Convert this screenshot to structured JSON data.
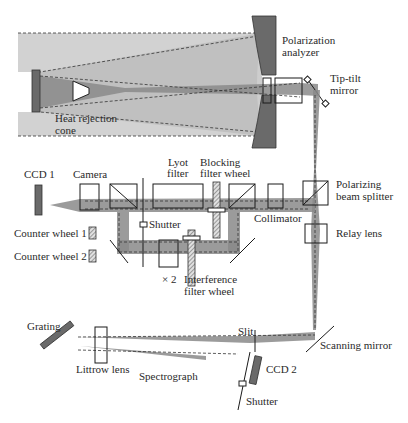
{
  "diagram": {
    "type": "optical-layout",
    "labels": {
      "polarization_analyzer_1": "Polarization",
      "polarization_analyzer_2": "analyzer",
      "tip_tilt_1": "Tip-tilt",
      "tip_tilt_2": "mirror",
      "heat_rejection_1": "Heat rejection",
      "heat_rejection_2": "cone",
      "ccd1": "CCD 1",
      "camera": "Camera",
      "lyot_1": "Lyot",
      "lyot_2": "filter",
      "blocking_1": "Blocking",
      "blocking_2": "filter wheel",
      "polarizing_bs_1": "Polarizing",
      "polarizing_bs_2": "beam splitter",
      "collimator": "Collimator",
      "shutter_top": "Shutter",
      "relay_lens": "Relay lens",
      "counter_wheel_1": "Counter wheel 1",
      "counter_wheel_2": "Counter wheel 2",
      "times_two": "× 2",
      "interference_1": "Interference",
      "interference_2": "filter wheel",
      "slit": "Slit",
      "grating": "Grating",
      "scanning_mirror": "Scanning mirror",
      "littrow_lens": "Littrow lens",
      "spectrograph": "Spectrograph",
      "ccd2": "CCD 2",
      "shutter_bottom": "Shutter"
    },
    "colors": {
      "beam": "#8a8a8a",
      "beam_light": "#b8b8b8",
      "beam_lighter": "#d2d2d2",
      "component_dark": "#6a6a6a",
      "outline": "#1a1a1a"
    }
  }
}
